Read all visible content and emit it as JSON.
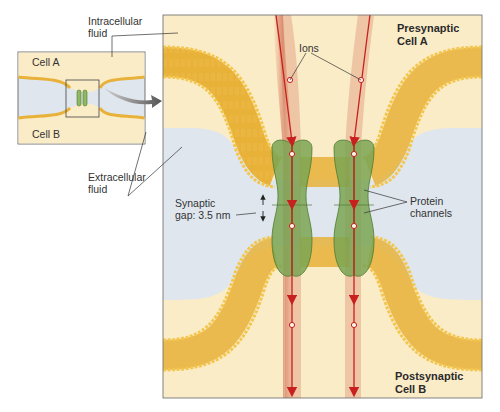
{
  "diagram": {
    "inset": {
      "cell_top_label": "Cell A",
      "cell_bottom_label": "Cell B"
    },
    "callouts": {
      "intracellular_fluid": "Intracellular fluid",
      "intracellular_line1": "Intracellular",
      "intracellular_line2": "fluid",
      "extracellular_line1": "Extracellular",
      "extracellular_line2": "fluid",
      "ions": "Ions",
      "synaptic_gap_line1": "Synaptic",
      "synaptic_gap_line2": "gap: 3.5 nm",
      "protein_channels_line1": "Protein",
      "protein_channels_line2": "channels"
    },
    "main_panel": {
      "presynaptic_line1": "Presynaptic",
      "presynaptic_line2": "Cell A",
      "postsynaptic_line1": "Postsynaptic",
      "postsynaptic_line2": "Cell B"
    },
    "colors": {
      "intracellular": "#fbecc8",
      "extracellular": "#dfe6ee",
      "membrane": "#e8b23a",
      "membrane_head": "#f3c74f",
      "channel": "#7aa552",
      "channel_dark": "#4f7a30",
      "ion_path": "#c8201e",
      "ion_glow": "#c8553c",
      "frame": "#666666"
    }
  }
}
